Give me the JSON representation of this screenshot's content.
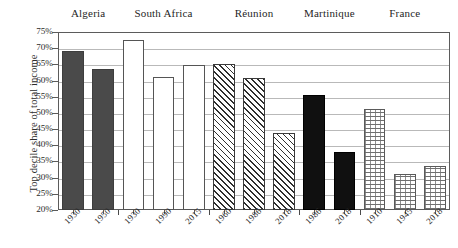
{
  "chart_data": {
    "type": "bar",
    "title": "",
    "xlabel": "",
    "ylabel": "Top decile share of total income",
    "ylim": [
      20,
      75
    ],
    "ytick_labels": [
      "75%",
      "70%",
      "65%",
      "60%",
      "55%",
      "50%",
      "45%",
      "40%",
      "35%",
      "30%",
      "25%",
      "20%"
    ],
    "ytick_values": [
      75,
      70,
      65,
      60,
      55,
      50,
      45,
      40,
      35,
      30,
      25,
      20
    ],
    "grid": true,
    "legend": "none",
    "groups": [
      {
        "name": "Algeria",
        "style": "solid-dark"
      },
      {
        "name": "South Africa",
        "style": "open"
      },
      {
        "name": "Réunion",
        "style": "hatch"
      },
      {
        "name": "Martinique",
        "style": "black"
      },
      {
        "name": "France",
        "style": "dotted"
      }
    ],
    "categories": [
      "1930",
      "1950",
      "1930",
      "1990",
      "2015",
      "1960",
      "1986",
      "2018",
      "1986",
      "2018",
      "1910",
      "1945",
      "2018"
    ],
    "values": [
      69,
      63.5,
      72.5,
      61,
      64.8,
      65,
      60.8,
      43.8,
      55.5,
      38,
      51.2,
      31,
      33.5
    ],
    "bars": [
      {
        "group": "Algeria",
        "year": "1930",
        "value": 69,
        "style": "solid-dark"
      },
      {
        "group": "Algeria",
        "year": "1950",
        "value": 63.5,
        "style": "solid-dark"
      },
      {
        "group": "South Africa",
        "year": "1930",
        "value": 72.5,
        "style": "open"
      },
      {
        "group": "South Africa",
        "year": "1990",
        "value": 61,
        "style": "open"
      },
      {
        "group": "South Africa",
        "year": "2015",
        "value": 64.8,
        "style": "open"
      },
      {
        "group": "Réunion",
        "year": "1960",
        "value": 65,
        "style": "hatch"
      },
      {
        "group": "Réunion",
        "year": "1986",
        "value": 60.8,
        "style": "hatch"
      },
      {
        "group": "Réunion",
        "year": "2018",
        "value": 43.8,
        "style": "hatch"
      },
      {
        "group": "Martinique",
        "year": "1986",
        "value": 55.5,
        "style": "black"
      },
      {
        "group": "Martinique",
        "year": "2018",
        "value": 38,
        "style": "black"
      },
      {
        "group": "France",
        "year": "1910",
        "value": 51.2,
        "style": "dotted"
      },
      {
        "group": "France",
        "year": "1945",
        "value": 31,
        "style": "dotted"
      },
      {
        "group": "France",
        "year": "2018",
        "value": 33.5,
        "style": "dotted"
      }
    ]
  }
}
